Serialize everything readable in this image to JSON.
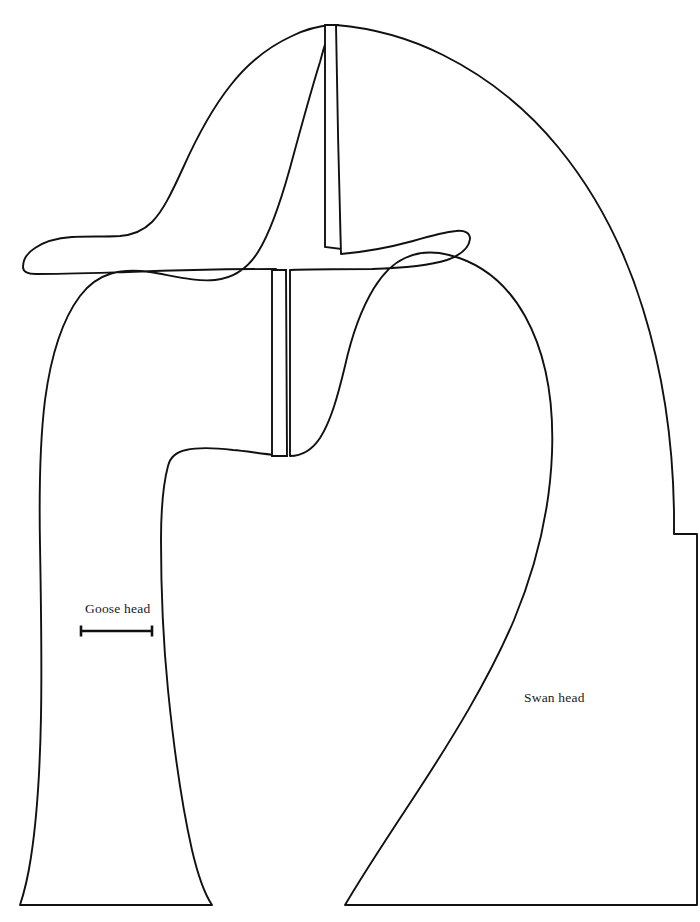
{
  "figure": {
    "kind": "line-art-template",
    "background_color": "#ffffff",
    "stroke_color": "#111111",
    "canvas": {
      "width": 700,
      "height": 922
    }
  },
  "labels": {
    "goose": "Goose head",
    "swan": "Swan head"
  },
  "scale_bar": {
    "x_start": 80,
    "x_end": 153,
    "y": 631,
    "cap_height": 11,
    "length_px": 73
  },
  "shapes": [
    {
      "name": "goose-head-outline",
      "label": "Goose head",
      "description": "Upper-left beak and head profile with long neck sweeping down to a flared flat base"
    },
    {
      "name": "goose-head-slit",
      "description": "Narrow vertical slot near top of goose head piece"
    },
    {
      "name": "swan-head-outline",
      "label": "Swan head",
      "description": "Large curved head and S-neck profile with beak pointing right, flaring to a flat base"
    },
    {
      "name": "swan-head-slit",
      "description": "Narrow vertical slot behind the swan beak"
    }
  ]
}
